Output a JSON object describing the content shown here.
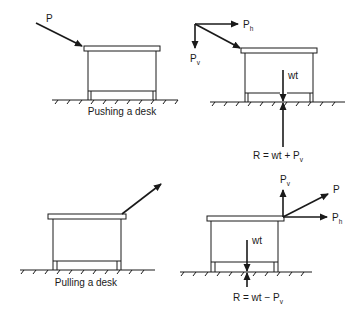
{
  "figure": {
    "panels": [
      {
        "id": "push-applied",
        "caption": "Pushing a desk",
        "force_label": "P"
      },
      {
        "id": "push-components",
        "labels": {
          "horizontal": "P",
          "horizontal_sub": "h",
          "vertical": "P",
          "vertical_sub": "v",
          "weight": "wt",
          "reaction": "R = wt + P",
          "reaction_sub": "v"
        }
      },
      {
        "id": "pull-applied",
        "caption": "Pulling a desk"
      },
      {
        "id": "pull-components",
        "labels": {
          "resultant": "P",
          "horizontal": "P",
          "horizontal_sub": "h",
          "vertical": "P",
          "vertical_sub": "v",
          "weight": "wt",
          "reaction": "R = wt − P",
          "reaction_sub": "v"
        }
      }
    ]
  }
}
